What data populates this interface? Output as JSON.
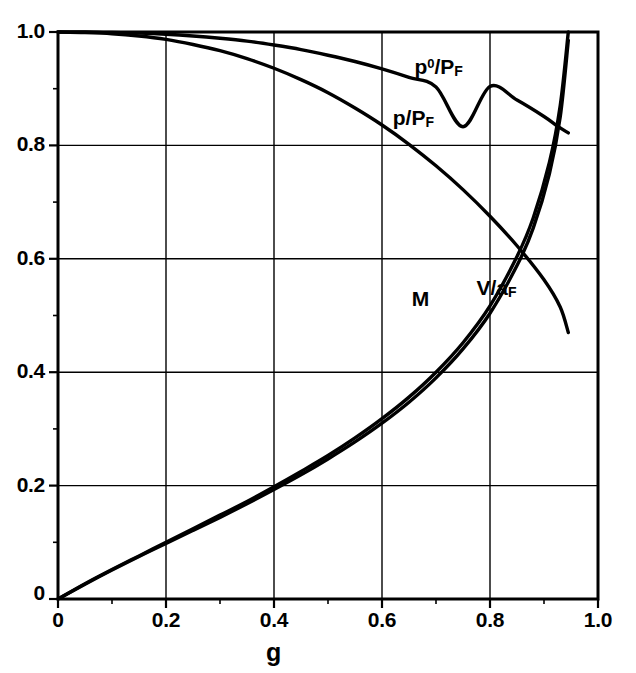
{
  "chart_data": {
    "type": "line",
    "title": "",
    "xlabel": "g",
    "ylabel": "",
    "xlim": [
      0,
      1.0
    ],
    "ylim": [
      0,
      1.0
    ],
    "grid": true,
    "legend_position": "inline-annotations",
    "xticks": [
      "0",
      "0.2",
      "0.4",
      "0.6",
      "0.8",
      "1.0"
    ],
    "xtick_values": [
      0,
      0.2,
      0.4,
      0.6,
      0.8,
      1.0
    ],
    "yticks": [
      "0",
      "0.2",
      "0.4",
      "0.6",
      "0.8",
      "1.0"
    ],
    "ytick_values": [
      0,
      0.2,
      0.4,
      0.6,
      0.8,
      1.0
    ],
    "minor_tick_step": 0.1,
    "line_color": "#000000",
    "series": [
      {
        "name": "p0/PF",
        "label_html": "p<sup>0</sup>/P<sub>F</sub>",
        "x": [
          0.0,
          0.05,
          0.1,
          0.15,
          0.2,
          0.25,
          0.3,
          0.35,
          0.4,
          0.45,
          0.5,
          0.55,
          0.6,
          0.65,
          0.7,
          0.75,
          0.8,
          0.85,
          0.9,
          0.925,
          0.945
        ],
        "values": [
          1.0,
          1.0,
          0.999,
          0.998,
          0.996,
          0.993,
          0.989,
          0.984,
          0.977,
          0.969,
          0.959,
          0.948,
          0.935,
          0.92,
          0.903,
          0.833,
          0.904,
          0.88,
          0.851,
          0.834,
          0.822
        ]
      },
      {
        "name": "p/PF",
        "label_html": "p/P<sub>F</sub>",
        "x": [
          0.0,
          0.05,
          0.1,
          0.15,
          0.2,
          0.25,
          0.3,
          0.35,
          0.4,
          0.45,
          0.5,
          0.55,
          0.6,
          0.65,
          0.7,
          0.75,
          0.8,
          0.85,
          0.9,
          0.93,
          0.945
        ],
        "values": [
          1.0,
          0.999,
          0.997,
          0.993,
          0.987,
          0.978,
          0.967,
          0.953,
          0.936,
          0.916,
          0.893,
          0.866,
          0.836,
          0.802,
          0.764,
          0.722,
          0.675,
          0.623,
          0.563,
          0.515,
          0.47
        ]
      },
      {
        "name": "M",
        "label_html": "M",
        "x": [
          0.0,
          0.05,
          0.1,
          0.15,
          0.2,
          0.25,
          0.3,
          0.35,
          0.4,
          0.45,
          0.5,
          0.55,
          0.6,
          0.65,
          0.7,
          0.75,
          0.8,
          0.85,
          0.88,
          0.91,
          0.93,
          0.945
        ],
        "values": [
          0.0,
          0.027,
          0.052,
          0.076,
          0.1,
          0.124,
          0.148,
          0.172,
          0.198,
          0.225,
          0.253,
          0.284,
          0.318,
          0.356,
          0.4,
          0.452,
          0.517,
          0.604,
          0.672,
          0.77,
          0.87,
          1.0
        ]
      },
      {
        "name": "V/aF",
        "label_html": "V/a<sub>F</sub>",
        "x": [
          0.0,
          0.05,
          0.1,
          0.15,
          0.2,
          0.25,
          0.3,
          0.35,
          0.4,
          0.45,
          0.5,
          0.55,
          0.6,
          0.65,
          0.7,
          0.75,
          0.8,
          0.85,
          0.88,
          0.91,
          0.93,
          0.945
        ],
        "values": [
          0.0,
          0.026,
          0.051,
          0.075,
          0.098,
          0.121,
          0.144,
          0.168,
          0.193,
          0.219,
          0.247,
          0.277,
          0.31,
          0.347,
          0.39,
          0.441,
          0.504,
          0.588,
          0.654,
          0.75,
          0.85,
          0.985
        ]
      }
    ],
    "annotations": [
      {
        "text": "p0/PF",
        "label_html": "p<sup>0</sup>/P<sub>F</sub>",
        "x": 0.66,
        "y": 0.935
      },
      {
        "text": "p/PF",
        "label_html": "p/P<sub>F</sub>",
        "x": 0.62,
        "y": 0.845
      },
      {
        "text": "M",
        "label_html": "M",
        "x": 0.655,
        "y": 0.525
      },
      {
        "text": "V/aF",
        "label_html": "V/a<sub>F</sub>",
        "x": 0.775,
        "y": 0.545
      }
    ]
  },
  "axis": {
    "title": "g"
  }
}
